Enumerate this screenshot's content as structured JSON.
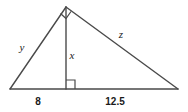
{
  "figure": {
    "background_color": "#ffffff",
    "stroke_color": "#4a4a4a",
    "label_color": "#1a1a1a",
    "geometry": {
      "apex": [
        66,
        7
      ],
      "left_vertex": [
        10,
        89
      ],
      "right_vertex": [
        178,
        89
      ],
      "altitude_foot": [
        66,
        89
      ]
    },
    "labels": {
      "leg_left": "y",
      "altitude": "x",
      "hypotenuse": "z",
      "base_left_length": "8",
      "base_right_length": "12.5"
    },
    "markers": {
      "apex_right_angle": "right-angle-marker",
      "foot_right_angle": "right-angle-marker"
    }
  }
}
